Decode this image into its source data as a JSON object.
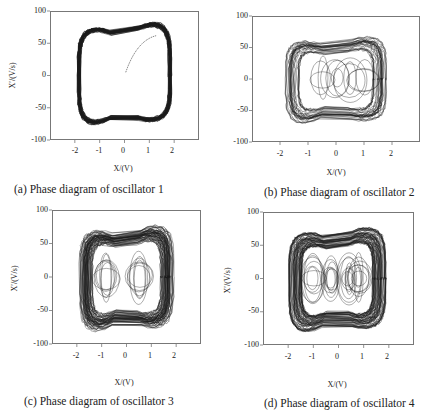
{
  "chart_data": [
    {
      "type": "scatter",
      "subtype": "phase-portrait",
      "title": "(a) Phase diagram of oscillator 1",
      "xlabel": "X/(V)",
      "ylabel": "X'/(V/s)",
      "xlim": [
        -3,
        3
      ],
      "ylim": [
        -100,
        100
      ],
      "xticks": [
        -2,
        -1,
        0,
        1,
        2
      ],
      "yticks": [
        -100,
        -50,
        0,
        50,
        100
      ],
      "description": "Single thick limit cycle; x spans about -1.9 to 1.9, x' spans about -75 to 80 with a dip near x=0 (~60 top, ~-55 bottom); transient trajectory from origin rising to upper orbit",
      "envelope": {
        "x_range": [
          -1.9,
          1.9
        ],
        "y_range": [
          -75,
          80
        ]
      }
    },
    {
      "type": "scatter",
      "subtype": "phase-portrait",
      "title": "(b) Phase diagram of oscillator 2",
      "xlabel": "X/(V)",
      "ylabel": "X'/(V/s)",
      "xlim": [
        -3,
        3
      ],
      "ylim": [
        -100,
        100
      ],
      "xticks": [
        -2,
        -1,
        0,
        1,
        2
      ],
      "yticks": [
        -100,
        -50,
        0,
        50,
        100
      ],
      "description": "Chaotic attractor with outer band and interior loops centered near x=-0.5, 0, 0.5, 1; x spans about -1.8 to 1.8, x' about -70 to 65",
      "envelope": {
        "x_range": [
          -1.8,
          1.8
        ],
        "y_range": [
          -70,
          65
        ]
      }
    },
    {
      "type": "scatter",
      "subtype": "phase-portrait",
      "title": "(c) Phase diagram of oscillator 3",
      "xlabel": "X/(V)",
      "ylabel": "X'/(V/s)",
      "xlim": [
        -3,
        3
      ],
      "ylim": [
        -100,
        100
      ],
      "xticks": [
        -2,
        -1,
        0,
        1,
        2
      ],
      "yticks": [
        -100,
        -50,
        0,
        50,
        100
      ],
      "description": "Dense chaotic attractor with two interior spiral centers near x=-0.8 and x=0.5; x spans about -1.9 to 1.9, x' about -80 to 75",
      "envelope": {
        "x_range": [
          -1.9,
          1.9
        ],
        "y_range": [
          -80,
          75
        ]
      }
    },
    {
      "type": "scatter",
      "subtype": "phase-portrait",
      "title": "(d) Phase diagram of oscillator 4",
      "xlabel": "X/(V)",
      "ylabel": "X'/(V/s)",
      "xlim": [
        -3,
        3
      ],
      "ylim": [
        -100,
        100
      ],
      "xticks": [
        -2,
        -1,
        0,
        1,
        2
      ],
      "yticks": [
        -100,
        -50,
        0,
        50,
        100
      ],
      "description": "Very dense chaotic attractor with multiple interior loops near x=-1, -0.3, 0.4, 0.8; x spans about -2 to 1.9, x' about -80 to 75",
      "envelope": {
        "x_range": [
          -2.0,
          1.9
        ],
        "y_range": [
          -80,
          75
        ]
      }
    }
  ],
  "panels": [
    {
      "caption": "(a) Phase diagram of oscillator 1",
      "xlabel": "X/(V)",
      "ylabel": "X′/(V/s)",
      "yticks": [
        "100",
        "50",
        "0",
        "-50",
        "-100"
      ],
      "xticks": [
        "-2",
        "-1",
        "0",
        "1",
        "2"
      ]
    },
    {
      "caption": "(b) Phase diagram of oscillator 2",
      "xlabel": "X/(V)",
      "ylabel": "X′/(V/s)",
      "yticks": [
        "100",
        "50",
        "0",
        "-50",
        "-100"
      ],
      "xticks": [
        "-2",
        "-1",
        "0",
        "1",
        "2"
      ]
    },
    {
      "caption": "(c) Phase diagram of oscillator 3",
      "xlabel": "X/(V)",
      "ylabel": "X′/(V/s)",
      "yticks": [
        "100",
        "50",
        "0",
        "-50",
        "-100"
      ],
      "xticks": [
        "-2",
        "-1",
        "0",
        "1",
        "2"
      ]
    },
    {
      "caption": "(d) Phase diagram of oscillator 4",
      "xlabel": "X/(V)",
      "ylabel": "X′/(V/s)",
      "yticks": [
        "100",
        "50",
        "0",
        "-50",
        "-100"
      ],
      "xticks": [
        "-2",
        "-1",
        "0",
        "1",
        "2"
      ]
    }
  ],
  "colors": {
    "trace": "#1a1a1a",
    "frame": "#777777",
    "background": "#ffffff"
  }
}
